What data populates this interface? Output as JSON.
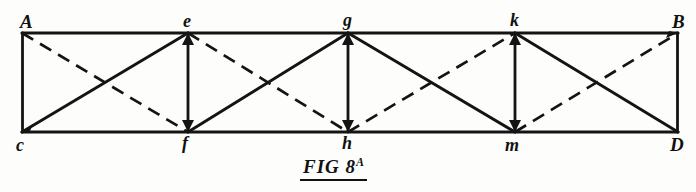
{
  "figure": {
    "caption_main": "FIG 8",
    "caption_superscript": "A",
    "line_color": "#141414",
    "background_color": "#fdfdfb",
    "top_chord_y": 33,
    "bottom_chord_y": 132
  },
  "nodes": {
    "top": [
      {
        "id": "A",
        "label": "A",
        "x": 22,
        "y": 33,
        "label_x": 20,
        "label_y": 12
      },
      {
        "id": "e",
        "label": "e",
        "x": 188,
        "y": 33,
        "label_x": 184,
        "label_y": 13
      },
      {
        "id": "g",
        "label": "g",
        "x": 348,
        "y": 33,
        "label_x": 343,
        "label_y": 12
      },
      {
        "id": "k",
        "label": "k",
        "x": 515,
        "y": 33,
        "label_x": 510,
        "label_y": 12
      },
      {
        "id": "B",
        "label": "B",
        "x": 678,
        "y": 33,
        "label_x": 672,
        "label_y": 12
      }
    ],
    "bottom": [
      {
        "id": "C",
        "label": "c",
        "x": 22,
        "y": 132,
        "label_x": 17,
        "label_y": 136
      },
      {
        "id": "f",
        "label": "f",
        "x": 188,
        "y": 132,
        "label_x": 183,
        "label_y": 134
      },
      {
        "id": "h",
        "label": "h",
        "x": 348,
        "y": 132,
        "label_x": 343,
        "label_y": 134
      },
      {
        "id": "m",
        "label": "m",
        "x": 515,
        "y": 132,
        "label_x": 506,
        "label_y": 136
      },
      {
        "id": "D",
        "label": "D",
        "x": 678,
        "y": 132,
        "label_x": 671,
        "label_y": 136
      }
    ]
  },
  "members": {
    "chords": [
      {
        "name": "top-chord",
        "x1": 22,
        "y1": 33,
        "x2": 678,
        "y2": 33,
        "style": "solid"
      },
      {
        "name": "bottom-chord",
        "x1": 22,
        "y1": 132,
        "x2": 678,
        "y2": 132,
        "style": "solid"
      }
    ],
    "verticals": [
      {
        "name": "vertical-A-C",
        "x1": 22,
        "y1": 33,
        "x2": 22,
        "y2": 132,
        "style": "solid"
      },
      {
        "name": "vertical-e-f",
        "x1": 188,
        "y1": 33,
        "x2": 188,
        "y2": 132,
        "style": "solid"
      },
      {
        "name": "vertical-g-h",
        "x1": 348,
        "y1": 33,
        "x2": 348,
        "y2": 132,
        "style": "solid"
      },
      {
        "name": "vertical-k-m",
        "x1": 515,
        "y1": 33,
        "x2": 515,
        "y2": 132,
        "style": "solid"
      },
      {
        "name": "vertical-B-D",
        "x1": 678,
        "y1": 33,
        "x2": 678,
        "y2": 132,
        "style": "solid"
      }
    ],
    "diagonals_solid": [
      {
        "name": "diagonal-C-e",
        "x1": 22,
        "y1": 132,
        "x2": 188,
        "y2": 33
      },
      {
        "name": "diagonal-f-g",
        "x1": 188,
        "y1": 132,
        "x2": 348,
        "y2": 33
      },
      {
        "name": "diagonal-g-m",
        "x1": 348,
        "y1": 33,
        "x2": 515,
        "y2": 132
      },
      {
        "name": "diagonal-k-D",
        "x1": 515,
        "y1": 33,
        "x2": 678,
        "y2": 132
      }
    ],
    "diagonals_dashed": [
      {
        "name": "diagonal-A-f",
        "x1": 22,
        "y1": 33,
        "x2": 188,
        "y2": 132
      },
      {
        "name": "diagonal-e-h",
        "x1": 188,
        "y1": 33,
        "x2": 348,
        "y2": 132
      },
      {
        "name": "diagonal-h-k",
        "x1": 348,
        "y1": 132,
        "x2": 515,
        "y2": 33
      },
      {
        "name": "diagonal-m-B",
        "x1": 515,
        "y1": 132,
        "x2": 678,
        "y2": 33
      }
    ]
  },
  "arrowheads": [
    {
      "name": "arrowhead-at-C",
      "x": 22,
      "y": 132
    },
    {
      "name": "arrowhead-at-f",
      "x": 188,
      "y": 132
    },
    {
      "name": "arrowhead-at-h",
      "x": 348,
      "y": 132
    },
    {
      "name": "arrowhead-at-m",
      "x": 515,
      "y": 132
    },
    {
      "name": "arrowhead-at-e",
      "x": 188,
      "y": 33
    },
    {
      "name": "arrowhead-at-g",
      "x": 348,
      "y": 33
    },
    {
      "name": "arrowhead-at-k",
      "x": 515,
      "y": 33
    },
    {
      "name": "arrowhead-at-B",
      "x": 678,
      "y": 33
    }
  ]
}
